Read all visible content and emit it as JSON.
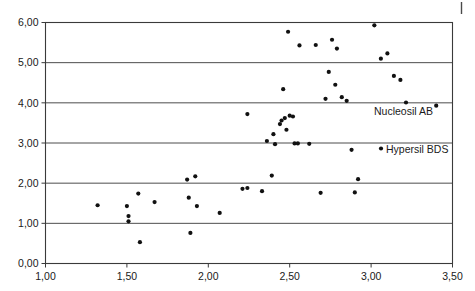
{
  "chart_data": {
    "type": "scatter",
    "title": "",
    "xlabel": "",
    "ylabel": "",
    "xlim": [
      1.0,
      3.5
    ],
    "ylim": [
      0.0,
      6.0
    ],
    "grid": true,
    "grid_axis": "y",
    "legend_position": "inside-right",
    "x_ticks": [
      "1,00",
      "1,50",
      "2,00",
      "2,50",
      "3,00",
      "3,50"
    ],
    "x_tick_values": [
      1.0,
      1.5,
      2.0,
      2.5,
      3.0,
      3.5
    ],
    "y_ticks": [
      "0,00",
      "1,00",
      "2,00",
      "3,00",
      "4,00",
      "5,00",
      "6,00"
    ],
    "y_tick_values": [
      0.0,
      1.0,
      2.0,
      3.0,
      4.0,
      5.0,
      6.0
    ],
    "series": [
      {
        "name": "Nucleosil AB",
        "marker": "dot",
        "color": "#111111",
        "points": [
          [
            1.32,
            1.45
          ],
          [
            1.5,
            1.43
          ],
          [
            1.51,
            1.18
          ],
          [
            1.51,
            1.05
          ],
          [
            1.57,
            1.74
          ],
          [
            1.58,
            0.53
          ],
          [
            1.67,
            1.53
          ],
          [
            1.87,
            2.09
          ],
          [
            1.88,
            1.64
          ],
          [
            1.89,
            0.76
          ],
          [
            1.92,
            2.17
          ],
          [
            1.93,
            1.43
          ],
          [
            2.07,
            1.26
          ],
          [
            2.21,
            1.86
          ],
          [
            2.24,
            1.88
          ],
          [
            2.24,
            3.72
          ],
          [
            2.33,
            1.8
          ],
          [
            2.36,
            3.05
          ],
          [
            2.39,
            2.19
          ],
          [
            2.4,
            3.22
          ],
          [
            2.41,
            2.97
          ],
          [
            2.44,
            3.47
          ],
          [
            2.45,
            3.56
          ],
          [
            2.46,
            4.34
          ],
          [
            2.47,
            3.62
          ],
          [
            2.48,
            3.33
          ],
          [
            2.49,
            5.77
          ],
          [
            2.5,
            3.68
          ],
          [
            2.52,
            3.66
          ],
          [
            2.53,
            2.99
          ],
          [
            2.55,
            2.99
          ],
          [
            2.56,
            5.43
          ],
          [
            2.62,
            2.98
          ],
          [
            2.66,
            5.44
          ],
          [
            2.69,
            1.76
          ],
          [
            2.72,
            4.1
          ],
          [
            2.74,
            4.77
          ],
          [
            2.76,
            5.57
          ],
          [
            2.78,
            4.45
          ],
          [
            2.79,
            5.35
          ],
          [
            2.82,
            4.14
          ],
          [
            2.85,
            4.05
          ],
          [
            2.88,
            2.83
          ],
          [
            2.9,
            1.77
          ],
          [
            2.92,
            2.1
          ],
          [
            3.02,
            5.93
          ],
          [
            3.06,
            5.1
          ],
          [
            3.1,
            5.23
          ],
          [
            3.14,
            4.67
          ],
          [
            3.18,
            4.57
          ],
          [
            3.4,
            3.93
          ]
        ]
      }
    ],
    "legend": [
      {
        "label": "Nucleosil AB",
        "marker": "dot",
        "color": "#111111"
      },
      {
        "label": "Hypersil BDS",
        "marker": "dot",
        "color": "#111111"
      }
    ]
  },
  "annotations": {
    "corner_mark": "page-edge-mark"
  }
}
